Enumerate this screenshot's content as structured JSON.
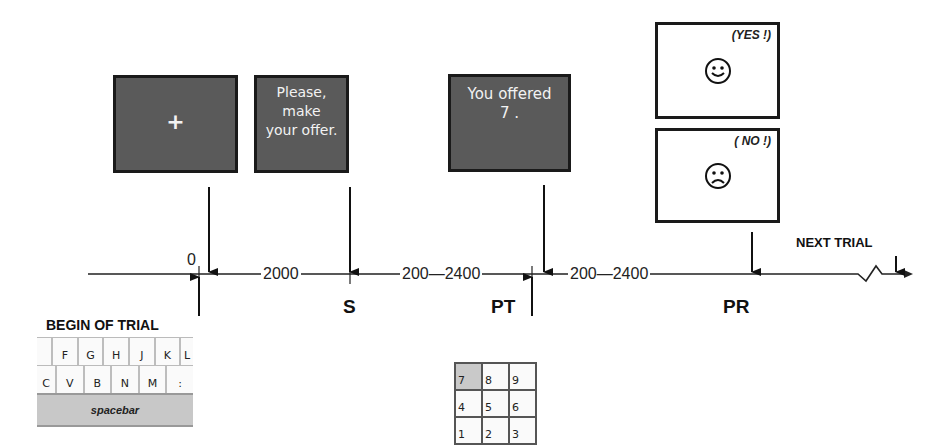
{
  "screens": {
    "fixation": {
      "text": "+"
    },
    "stimulus": {
      "line1": "Please, make",
      "line2": "your offer."
    },
    "proposal": {
      "line1": "You offered",
      "line2": "7 ."
    },
    "response_yes": {
      "tag": "(YES !)",
      "face": "smiley"
    },
    "response_no": {
      "tag": "( NO !)",
      "face": "frowny"
    }
  },
  "timeline": {
    "start_label": "0",
    "intervals": [
      "2000",
      "200—2400",
      "200—2400"
    ],
    "events": [
      {
        "id": "S",
        "label": "S"
      },
      {
        "id": "PT",
        "label": "PT"
      },
      {
        "id": "PR",
        "label": "PR"
      }
    ],
    "next_trial_label": "NEXT TRIAL"
  },
  "begin_trial": {
    "label": "BEGIN OF TRIAL",
    "keyboard": {
      "row1": [
        "",
        "F",
        "G",
        "H",
        "J",
        "K",
        "L"
      ],
      "row2": [
        "C",
        "V",
        "B",
        "N",
        "M",
        ":"
      ],
      "spacebar": "spacebar"
    }
  },
  "numpad": {
    "rows": [
      [
        "7",
        "8",
        "9"
      ],
      [
        "4",
        "5",
        "6"
      ],
      [
        "1",
        "2",
        "3"
      ]
    ],
    "pressed": "7"
  },
  "colors": {
    "screen_dark": "#5a5a5a",
    "line": "#1a1a1a",
    "pressed_key": "#c9c9c9"
  }
}
